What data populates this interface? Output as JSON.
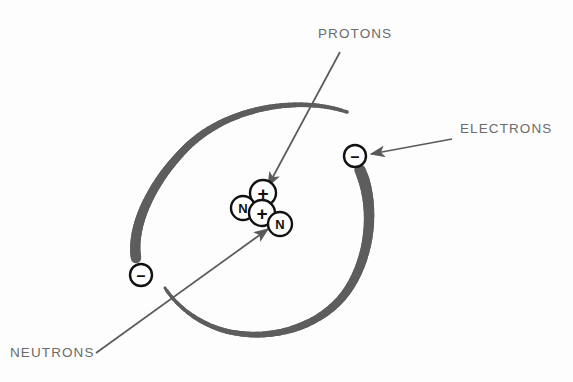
{
  "figure": {
    "background_color": "#fdfdfd",
    "width": 573,
    "height": 382
  },
  "colors": {
    "orbit_gray": "#5d5d5d",
    "label_gray": "#6b6b6b",
    "leader_gray": "#5a5a5a",
    "particle_outline": "#111111",
    "particle_fill": "#ffffff"
  },
  "labels": {
    "protons": {
      "text": "PROTONS",
      "x": 318,
      "y": 38
    },
    "electrons": {
      "text": "ELECTRONS",
      "x": 460,
      "y": 133
    },
    "neutrons": {
      "text": "NEUTRONS",
      "x": 10,
      "y": 357
    }
  },
  "nucleus": {
    "name": "nucleus",
    "particles": [
      {
        "id": "proton-top",
        "glyph": "+",
        "type": "proton",
        "cx": 263,
        "cy": 193,
        "r": 13,
        "font_size": 19
      },
      {
        "id": "neutron-left",
        "glyph": "N",
        "type": "neutron",
        "cx": 243,
        "cy": 208,
        "r": 12,
        "font_size": 13
      },
      {
        "id": "proton-center",
        "glyph": "+",
        "type": "proton",
        "cx": 262,
        "cy": 213,
        "r": 13,
        "font_size": 19
      },
      {
        "id": "neutron-right",
        "glyph": "N",
        "type": "neutron",
        "cx": 280,
        "cy": 224,
        "r": 12,
        "font_size": 13
      }
    ]
  },
  "electrons": [
    {
      "id": "electron-right",
      "glyph": "–",
      "cx": 355,
      "cy": 156,
      "r": 11,
      "font_size": 16
    },
    {
      "id": "electron-left",
      "glyph": "–",
      "cx": 141,
      "cy": 275,
      "r": 11,
      "font_size": 16
    }
  ],
  "orbit": {
    "name": "electron-orbit",
    "description": "tilted elliptical orbit drawn as two thick gray arcs broken at each electron",
    "color": "#5d5d5d",
    "arc_upper_left_d": "M 347 112 C 300 96, 228 106, 186 148 C 150 184, 131 228, 136 258",
    "arc_upper_left_widths": [
      3.5,
      10.5
    ],
    "arc_lower_right_d": "M 360 170 C 372 196, 375 244, 351 285 C 327 326, 270 344, 222 330 C 196 322, 176 305, 165 288",
    "arc_lower_right_widths": [
      11.5,
      3.0
    ]
  },
  "leaders": [
    {
      "id": "protons-leader",
      "from_label": "protons",
      "x1": 340,
      "y1": 52,
      "x2": 268,
      "y2": 186,
      "arrow": "end",
      "width": 1.7
    },
    {
      "id": "electrons-leader",
      "from_label": "electrons",
      "x1": 452,
      "y1": 139,
      "x2": 371,
      "y2": 154,
      "arrow": "end",
      "width": 1.7
    },
    {
      "id": "neutrons-leader",
      "from_label": "neutrons",
      "x1": 96,
      "y1": 353,
      "x2": 268,
      "y2": 229,
      "arrow": "end",
      "width": 1.7
    }
  ]
}
